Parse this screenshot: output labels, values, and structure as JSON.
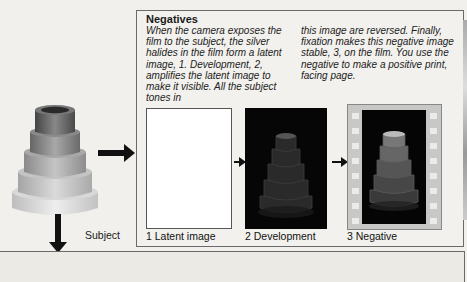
{
  "section": {
    "title": "Negatives",
    "paragraph_col1": "When the camera exposes the film to the subject, the silver halides in the film form a latent image, 1. Development, 2, amplifies the latent image to make it visible. All the subject tones in",
    "paragraph_col2": "this image are reversed. Finally, fixation makes this negative image stable, 3, on the film. You use the negative to make a positive print, facing page."
  },
  "subject": {
    "label": "Subject"
  },
  "stages": [
    {
      "number": "1",
      "caption": "1 Latent image"
    },
    {
      "number": "2",
      "caption": "2 Development"
    },
    {
      "number": "3",
      "caption": "3 Negative"
    }
  ],
  "colors": {
    "page_background": "#f1f0ec",
    "panel_border": "#6a6a6a",
    "negative_black": "#050505",
    "film_strip": "#c8c8c6"
  }
}
